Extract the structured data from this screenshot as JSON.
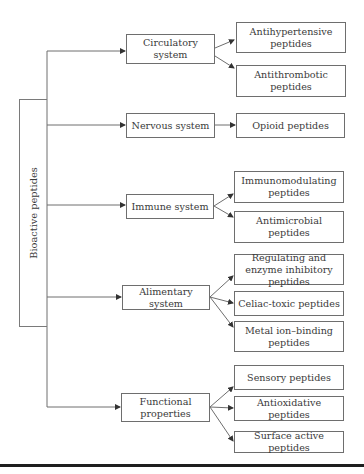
{
  "root": {
    "label": "Bioactive peptides"
  },
  "categories": [
    {
      "label": "Circulatory system",
      "children": [
        {
          "label": "Antihypertensive peptides"
        },
        {
          "label": "Antithrombotic peptides"
        }
      ]
    },
    {
      "label": "Nervous system",
      "children": [
        {
          "label": "Opioid peptides"
        }
      ]
    },
    {
      "label": "Immune system",
      "children": [
        {
          "label": "Immunomodulating peptides"
        },
        {
          "label": "Antimicrobial peptides"
        }
      ]
    },
    {
      "label": "Alimentary system",
      "children": [
        {
          "label": "Regulating and enzyme inhibitory peptides"
        },
        {
          "label": "Celiac-toxic peptides"
        },
        {
          "label": "Metal ion–binding peptides"
        }
      ]
    },
    {
      "label": "Functional properties",
      "children": [
        {
          "label": "Sensory peptides"
        },
        {
          "label": "Antioxidative peptides"
        },
        {
          "label": "Surface active peptides"
        }
      ]
    }
  ],
  "colors": {
    "line": "#6e6e6e",
    "text": "#3a3a3a",
    "rule": "#1e1e1e"
  }
}
